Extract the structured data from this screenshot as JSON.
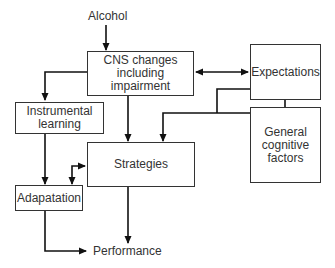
{
  "diagram": {
    "nodes": {
      "alcohol": "Alcohol",
      "cns": "CNS changes\nincluding impairment",
      "expectations": "Expectations",
      "general_cognitive": "General\ncognitive\nfactors",
      "instrumental": "Instrumental\nlearning",
      "strategies": "Strategies",
      "adaptation": "Adapatation",
      "performance": "Performance"
    },
    "edges": [
      {
        "from": "Alcohol",
        "to": "CNS changes including impairment"
      },
      {
        "from": "CNS changes including impairment",
        "to": "Expectations",
        "bidirectional": true
      },
      {
        "from": "Expectations",
        "to": "General cognitive factors",
        "bidirectional": true
      },
      {
        "from": "CNS changes including impairment",
        "to": "Instrumental learning"
      },
      {
        "from": "CNS changes including impairment",
        "to": "Strategies"
      },
      {
        "from": "Expectations",
        "to": "Strategies"
      },
      {
        "from": "General cognitive factors",
        "to": "Strategies"
      },
      {
        "from": "Instrumental learning",
        "to": "Adapatation"
      },
      {
        "from": "Adapatation",
        "to": "Strategies",
        "bidirectional": true
      },
      {
        "from": "Strategies",
        "to": "Performance"
      },
      {
        "from": "Adapatation",
        "to": "Performance"
      }
    ],
    "colors": {
      "line": "#111111",
      "box_border": "#333333",
      "background": "#ffffff"
    }
  }
}
